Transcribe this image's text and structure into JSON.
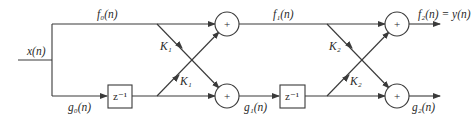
{
  "diagram": {
    "input_label": "x(n)",
    "stage1": {
      "f_in": "f₀(n)",
      "g_in": "g₀(n)",
      "delay": "z⁻¹",
      "k_top": "K₁",
      "k_bottom": "K₁",
      "adder_top": "+",
      "adder_bottom": "+"
    },
    "stage2": {
      "f_in": "f₁(n)",
      "g_in": "g₁(n)",
      "delay": "z⁻¹",
      "k_top": "K₂",
      "k_bottom": "K₂",
      "adder_top": "+",
      "adder_bottom": "+"
    },
    "outputs": {
      "f_out": "f₂(n) = y(n)",
      "g_out": "g₂(n)"
    },
    "colors": {
      "line": "#3a3a3a",
      "text": "#2a2a2a",
      "background": "#ffffff"
    }
  }
}
